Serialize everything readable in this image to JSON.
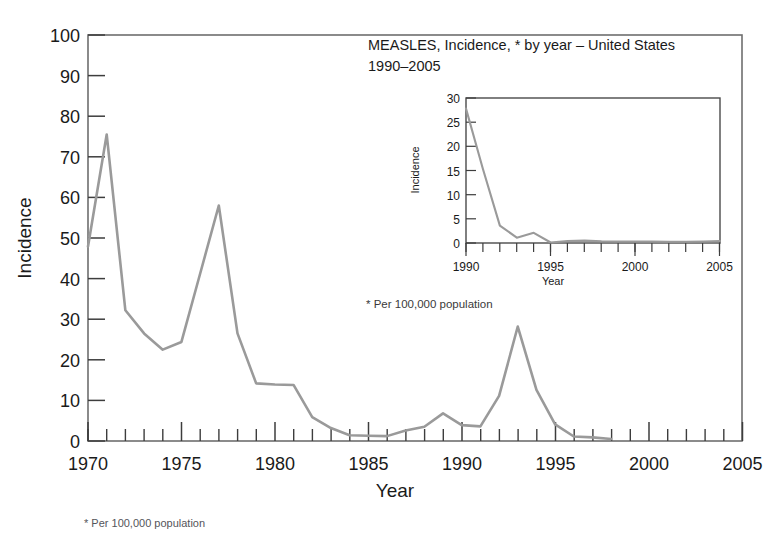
{
  "chart_data": [
    {
      "id": "main",
      "type": "line",
      "title": "",
      "xlabel": "Year",
      "ylabel": "Incidence",
      "xlim": [
        1970,
        2005
      ],
      "ylim": [
        0,
        100
      ],
      "xticks": [
        1970,
        1975,
        1980,
        1985,
        1990,
        1995,
        2000,
        2005
      ],
      "xtick_labels": [
        "1970",
        "1975",
        "1980",
        "1985",
        "1990",
        "1995",
        "2000",
        "2005"
      ],
      "yticks": [
        0,
        10,
        20,
        30,
        40,
        50,
        60,
        70,
        80,
        90,
        100
      ],
      "ytick_labels": [
        "0",
        "10",
        "20",
        "30",
        "40",
        "50",
        "60",
        "70",
        "80",
        "90",
        "100"
      ],
      "minor_xtick_step": 1,
      "grid": false,
      "legend": false,
      "line_color": "#9a9a9a",
      "x": [
        1970,
        1971,
        1972,
        1973,
        1974,
        1975,
        1976,
        1977,
        1978,
        1979,
        1980,
        1981,
        1982,
        1983,
        1984,
        1985,
        1986,
        1987,
        1988,
        1989,
        1990,
        1991,
        1992,
        1993,
        1994,
        1995,
        1996,
        1997,
        1998
      ],
      "values": [
        47.9,
        75.5,
        32.2,
        26.5,
        22.5,
        24.4,
        41.2,
        58.0,
        26.5,
        14.2,
        13.9,
        13.8,
        5.9,
        3.2,
        1.4,
        1.3,
        1.2,
        2.6,
        3.5,
        6.8,
        3.9,
        3.6,
        11.1,
        28.2,
        12.6,
        4.1,
        1.1,
        0.9,
        0.5
      ],
      "note": "* Per 100,000 population",
      "series_end_year": 1998
    },
    {
      "id": "inset",
      "type": "line",
      "title": "MEASLES, Incidence, * by year – United States 1990–2005",
      "title_line1": "MEASLES, Incidence, * by year – United States",
      "title_line2": "1990–2005",
      "xlabel": "Year",
      "ylabel": "Incidence",
      "xlim": [
        1990,
        2005
      ],
      "ylim": [
        0,
        30
      ],
      "xticks": [
        1990,
        1995,
        2000,
        2005
      ],
      "xtick_labels": [
        "1990",
        "1995",
        "2000",
        "2005"
      ],
      "yticks": [
        0,
        5,
        10,
        15,
        20,
        25,
        30
      ],
      "ytick_labels": [
        "0",
        "5",
        "10",
        "15",
        "20",
        "25",
        "30"
      ],
      "minor_xtick_step": 1,
      "grid": false,
      "legend": false,
      "line_color": "#9a9a9a",
      "x": [
        1990,
        1991,
        1992,
        1993,
        1994,
        1995,
        1996,
        1997,
        1998,
        1999,
        2000,
        2001,
        2002,
        2003,
        2004,
        2005
      ],
      "values": [
        27.8,
        15.3,
        3.6,
        1.1,
        2.1,
        0.1,
        0.4,
        0.5,
        0.35,
        0.3,
        0.3,
        0.3,
        0.25,
        0.25,
        0.3,
        0.4
      ],
      "note": "* Per 100,000 population"
    }
  ],
  "main_chart": {
    "ylabel": "Incidence",
    "xlabel": "Year",
    "ytick_labels": [
      "100",
      "90",
      "80",
      "70",
      "60",
      "50",
      "40",
      "30",
      "20",
      "10",
      "0"
    ],
    "xtick_labels": [
      "1970",
      "1975",
      "1980",
      "1985",
      "1990",
      "1995",
      "2000",
      "2005"
    ]
  },
  "inset_chart": {
    "ylabel": "Incidence",
    "xlabel": "Year",
    "ytick_labels": [
      "30",
      "25",
      "20",
      "15",
      "10",
      "5",
      "0"
    ],
    "xtick_labels": [
      "1990",
      "1995",
      "2000",
      "2005"
    ]
  },
  "title": {
    "line1": "MEASLES, Incidence, * by year – United States",
    "line2": "1990–2005"
  },
  "notes": {
    "inner": "* Per 100,000 population",
    "outer": "* Per 100,000 population"
  },
  "colors": {
    "line": "#9a9a9a",
    "axis": "#3d3d3d",
    "frame": "#6e6e6e",
    "text": "#1a1a1a",
    "background": "#ffffff"
  }
}
